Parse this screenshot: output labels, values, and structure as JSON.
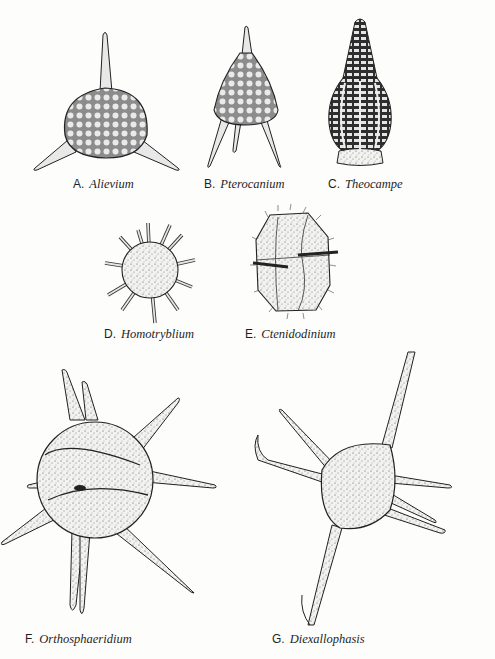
{
  "figure": {
    "panels": [
      {
        "letter": "A.",
        "genus": "Alievium",
        "group": "Radiolarian (spumellarian)"
      },
      {
        "letter": "B.",
        "genus": "Pterocanium",
        "group": "Radiolarian (nassellarian)"
      },
      {
        "letter": "C.",
        "genus": "Theocampe",
        "group": "Radiolarian (nassellarian)"
      },
      {
        "letter": "D.",
        "genus": "Homotryblium",
        "group": "Dinoflagellate cyst"
      },
      {
        "letter": "E.",
        "genus": "Ctenidodinium",
        "group": "Dinoflagellate cyst"
      },
      {
        "letter": "F.",
        "genus": "Orthosphaeridium",
        "group": "Acritarch"
      },
      {
        "letter": "G.",
        "genus": "Diexallophasis",
        "group": "Acritarch"
      }
    ]
  },
  "colors": {
    "ink": "#1f1f1f",
    "shade": "#bdbdbd",
    "paper": "#fdfdfb"
  }
}
